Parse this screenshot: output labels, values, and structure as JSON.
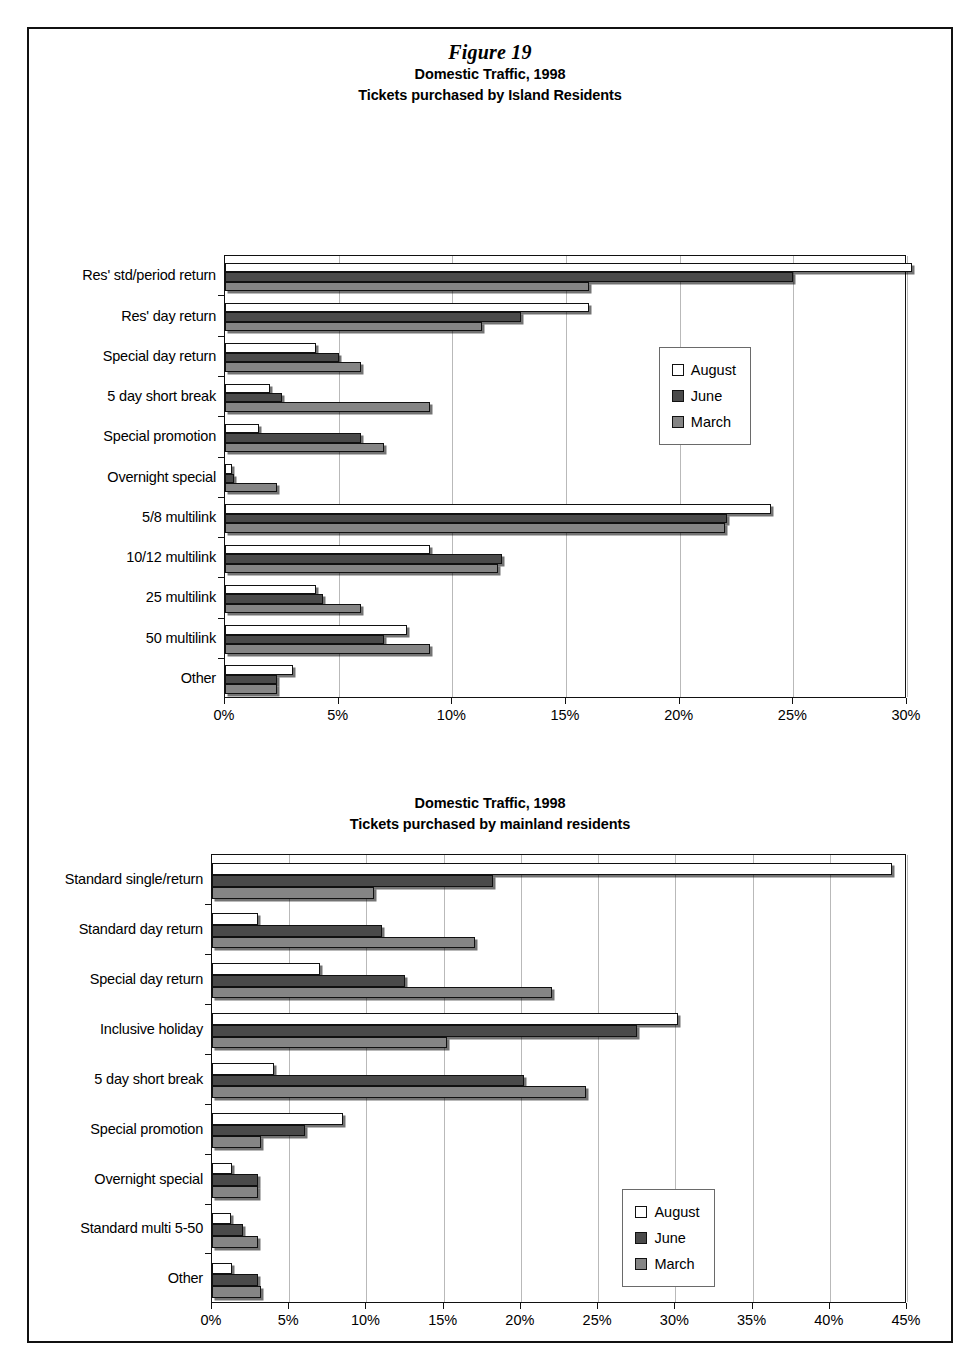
{
  "figure": {
    "label": "Figure 19"
  },
  "legend": {
    "series": [
      {
        "name": "August",
        "color": "#ffffff"
      },
      {
        "name": "June",
        "color": "#4a4a4a"
      },
      {
        "name": "March",
        "color": "#858585"
      }
    ]
  },
  "chart_data": [
    {
      "type": "bar",
      "orientation": "horizontal",
      "title": "Domestic Traffic, 1998",
      "subtitle": "Tickets purchased by Island Residents",
      "xlabel": "",
      "ylabel": "",
      "xlim": [
        0,
        30
      ],
      "xticks": [
        0,
        5,
        10,
        15,
        20,
        25,
        30
      ],
      "xticklabels": [
        "0%",
        "5%",
        "10%",
        "15%",
        "20%",
        "25%",
        "30%"
      ],
      "grid": true,
      "legend_position": "upper-right-inside",
      "categories": [
        "Res' std/period return",
        "Res' day return",
        "Special day return",
        "5 day short break",
        "Special promotion",
        "Overnight special",
        "5/8 multilink",
        "10/12 multilink",
        "25 multilink",
        "50 multilink",
        "Other"
      ],
      "series": [
        {
          "name": "August",
          "values": [
            30.2,
            16.0,
            4.0,
            2.0,
            1.5,
            0.3,
            24.0,
            9.0,
            4.0,
            8.0,
            3.0
          ]
        },
        {
          "name": "June",
          "values": [
            25.0,
            13.0,
            5.0,
            2.5,
            6.0,
            0.4,
            22.1,
            12.2,
            4.3,
            7.0,
            2.3
          ]
        },
        {
          "name": "March",
          "values": [
            16.0,
            11.3,
            6.0,
            9.0,
            7.0,
            2.3,
            22.0,
            12.0,
            6.0,
            9.0,
            2.3
          ]
        }
      ]
    },
    {
      "type": "bar",
      "orientation": "horizontal",
      "title": "Domestic Traffic, 1998",
      "subtitle": "Tickets purchased by mainland residents",
      "xlabel": "",
      "ylabel": "",
      "xlim": [
        0,
        45
      ],
      "xticks": [
        0,
        5,
        10,
        15,
        20,
        25,
        30,
        35,
        40,
        45
      ],
      "xticklabels": [
        "0%",
        "5%",
        "10%",
        "15%",
        "20%",
        "25%",
        "30%",
        "35%",
        "40%",
        "45%"
      ],
      "grid": true,
      "legend_position": "lower-right-inside",
      "categories": [
        "Standard single/return",
        "Standard day return",
        "Special day return",
        "Inclusive holiday",
        "5 day short break",
        "Special promotion",
        "Overnight special",
        "Standard multi 5-50",
        "Other"
      ],
      "series": [
        {
          "name": "August",
          "values": [
            44.0,
            3.0,
            7.0,
            30.2,
            4.0,
            8.5,
            1.3,
            1.2,
            1.3
          ]
        },
        {
          "name": "June",
          "values": [
            18.2,
            11.0,
            12.5,
            27.5,
            20.2,
            6.0,
            3.0,
            2.0,
            3.0
          ]
        },
        {
          "name": "March",
          "values": [
            10.5,
            17.0,
            22.0,
            15.2,
            24.2,
            3.2,
            3.0,
            3.0,
            3.2
          ]
        }
      ]
    }
  ]
}
